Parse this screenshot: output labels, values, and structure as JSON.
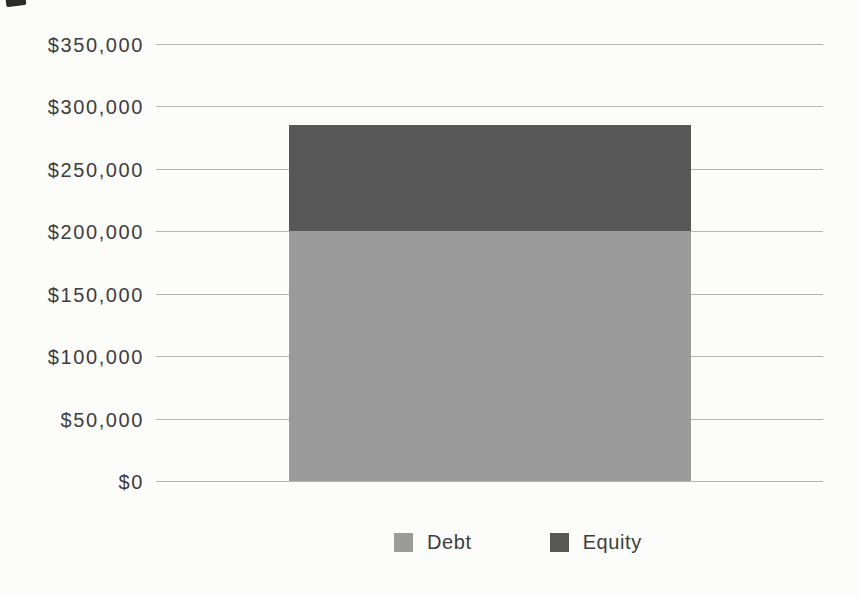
{
  "page": {
    "background": "#fcfcfb"
  },
  "chart_data": {
    "type": "bar",
    "stacked": true,
    "title": "",
    "xlabel": "",
    "ylabel": "",
    "categories": [
      ""
    ],
    "series": [
      {
        "name": "Debt",
        "values": [
          200000
        ],
        "color": "#9b9b9b"
      },
      {
        "name": "Equity",
        "values": [
          85000
        ],
        "color": "#575757"
      }
    ],
    "total": 285000,
    "ylim": [
      0,
      350000
    ],
    "y_tick_step": 50000,
    "y_ticks": [
      {
        "value": 0,
        "label": "$0"
      },
      {
        "value": 50000,
        "label": "$50,000"
      },
      {
        "value": 100000,
        "label": "$100,000"
      },
      {
        "value": 150000,
        "label": "$150,000"
      },
      {
        "value": 200000,
        "label": "$200,000"
      },
      {
        "value": 250000,
        "label": "$250,000"
      },
      {
        "value": 300000,
        "label": "$300,000"
      },
      {
        "value": 350000,
        "label": "$350,000"
      }
    ],
    "grid": "horizontal",
    "gridline_color": "#a8a8a8",
    "legend_position": "bottom",
    "text_color": "#3d3d3d"
  }
}
